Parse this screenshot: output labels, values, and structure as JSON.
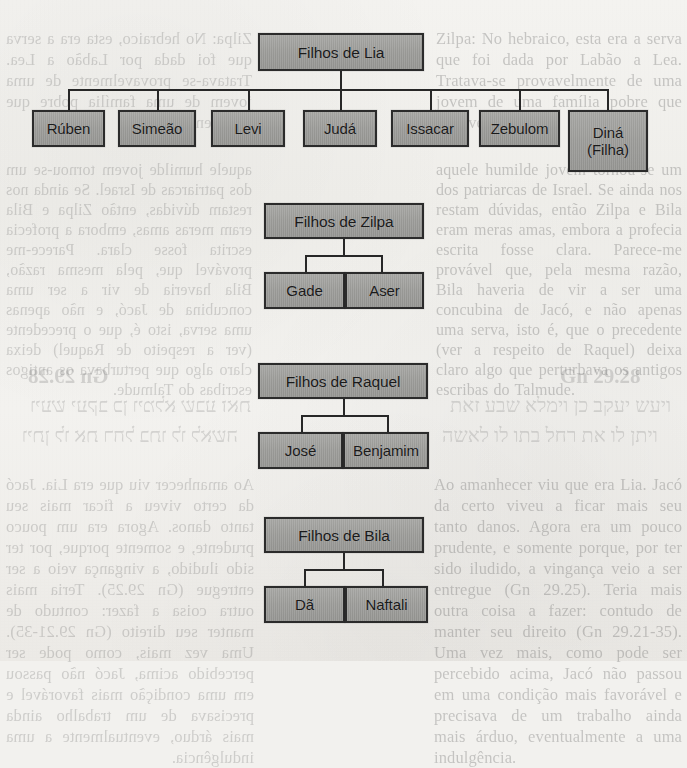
{
  "page": {
    "background_color": "#f2f1ee",
    "node_fill_color": "#9b9b98",
    "node_border_color": "#2b2b2b",
    "connector_color": "#272727"
  },
  "diagrams": [
    {
      "id": "lia",
      "root": "Filhos de Lia",
      "children": [
        "Rúben",
        "Simeão",
        "Levi",
        "Judá",
        "Issacar",
        "Zebulom",
        "Diná\n(Filha)"
      ]
    },
    {
      "id": "zilpa",
      "root": "Filhos de Zilpa",
      "children": [
        "Gade",
        "Aser"
      ]
    },
    {
      "id": "raquel",
      "root": "Filhos de Raquel",
      "children": [
        "José",
        "Benjamim"
      ]
    },
    {
      "id": "bila",
      "root": "Filhos de Bila",
      "children": [
        "Dã",
        "Naftali"
      ]
    }
  ],
  "nodes": {
    "lia_root": "Filhos de Lia",
    "lia_c1": "Rúben",
    "lia_c2": "Simeão",
    "lia_c3": "Levi",
    "lia_c4": "Judá",
    "lia_c5": "Issacar",
    "lia_c6": "Zebulom",
    "lia_c7_line1": "Diná",
    "lia_c7_line2": "(Filha)",
    "zilpa_root": "Filhos de Zilpa",
    "zilpa_c1": "Gade",
    "zilpa_c2": "Aser",
    "raquel_root": "Filhos de Raquel",
    "raquel_c1": "José",
    "raquel_c2": "Benjamim",
    "bila_root": "Filhos de Bila",
    "bila_c1": "Dã",
    "bila_c2": "Naftali"
  },
  "background_text": {
    "right_col_top": "Zilpa: No hebraico, esta era a serva que foi dada por Labão a Lea. Tratava-se provavelmente de uma jovem de uma família pobre que fora vendida",
    "right_col_mid": "aquele humilde jovem tornou-se um dos patriarcas de Israel. Se ainda nos restam dúvidas, então Zilpa e Bila eram meras amas, embora a profecia escrita fosse clara. Parece-me provável que, pela mesma razão, Bila haveria de vir a ser uma concubina de Jacó, e não apenas uma serva, isto é, que o precedente (ver a respeito de Raquel) deixa claro algo que perturbava os antigos escribas do Talmude.",
    "reference": "Gn 29.28",
    "hebrew_line1": "ויעש יעקב כן וימלא שבע זאת",
    "hebrew_line2": "ויתן לו את רחל בתו לו לאשה",
    "bottom_col": "Ao amanhecer viu que era Lia. Jacó da certo viveu a ficar mais seu tanto danos. Agora era um pouco prudente, e somente porque, por ter sido iludido, a vingança veio a ser entregue (Gn 29.25). Teria mais outra coisa a fazer: contudo de manter seu direito (Gn 29.21-35). Uma vez mais, como pode ser percebido acima, Jacó não passou em uma condição mais favorável e precisava de um trabalho ainda mais árduo, eventualmente a uma indulgência."
  }
}
